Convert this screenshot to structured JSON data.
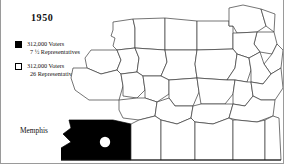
{
  "figure": {
    "title": "1950",
    "region_label": "Memphis"
  },
  "legend": {
    "entries": [
      {
        "swatch": "filled-black-square",
        "voters": "312,000 Voters",
        "representatives": "7 ½ Representatives"
      },
      {
        "swatch": "hollow-white-square",
        "voters": "312,000 Voters",
        "representatives": "26 Representatives"
      }
    ]
  },
  "map": {
    "shaded_county_label": "Memphis",
    "city_marker": "white-dot"
  },
  "colors": {
    "shaded_fill": "#000000",
    "unshaded_fill": "#ffffff",
    "county_border": "#3a3a3a",
    "state_border": "#111111",
    "text": "#111111",
    "frame": "#9a9a9a"
  }
}
